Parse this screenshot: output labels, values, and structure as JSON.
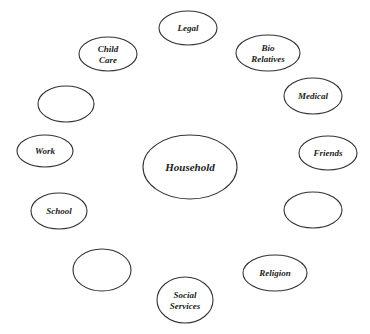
{
  "diagram": {
    "type": "ecomap",
    "center": {
      "id": "household",
      "lines": [
        "Household"
      ],
      "cx": 190,
      "cy": 167,
      "rx": 47,
      "ry": 32,
      "font_size": 11
    },
    "nodes": [
      {
        "id": "legal",
        "lines": [
          "Legal"
        ],
        "cx": 188,
        "cy": 28,
        "rx": 29,
        "ry": 17
      },
      {
        "id": "bio-relatives",
        "lines": [
          "Bio",
          "Relatives"
        ],
        "cx": 268,
        "cy": 53,
        "rx": 32,
        "ry": 18
      },
      {
        "id": "medical",
        "lines": [
          "Medical"
        ],
        "cx": 313,
        "cy": 96,
        "rx": 29,
        "ry": 18
      },
      {
        "id": "friends",
        "lines": [
          "Friends"
        ],
        "cx": 328,
        "cy": 153,
        "rx": 29,
        "ry": 17
      },
      {
        "id": "empty-right",
        "lines": [],
        "cx": 313,
        "cy": 210,
        "rx": 29,
        "ry": 18
      },
      {
        "id": "religion",
        "lines": [
          "Religion"
        ],
        "cx": 275,
        "cy": 273,
        "rx": 32,
        "ry": 18
      },
      {
        "id": "social-services",
        "lines": [
          "Social",
          "Services"
        ],
        "cx": 185,
        "cy": 300,
        "rx": 28,
        "ry": 23
      },
      {
        "id": "empty-bottom-left",
        "lines": [],
        "cx": 102,
        "cy": 270,
        "rx": 29,
        "ry": 21
      },
      {
        "id": "school",
        "lines": [
          "School"
        ],
        "cx": 59,
        "cy": 211,
        "rx": 28,
        "ry": 18
      },
      {
        "id": "work",
        "lines": [
          "Work"
        ],
        "cx": 45,
        "cy": 151,
        "rx": 28,
        "ry": 16
      },
      {
        "id": "empty-left",
        "lines": [],
        "cx": 66,
        "cy": 104,
        "rx": 28,
        "ry": 18
      },
      {
        "id": "child-care",
        "lines": [
          "Child",
          "Care"
        ],
        "cx": 108,
        "cy": 54,
        "rx": 29,
        "ry": 17
      }
    ],
    "style": {
      "stroke": "#333333",
      "stroke_width": 1.1,
      "fill": "#ffffff",
      "text_color": "#222222",
      "font_size": 9
    }
  }
}
